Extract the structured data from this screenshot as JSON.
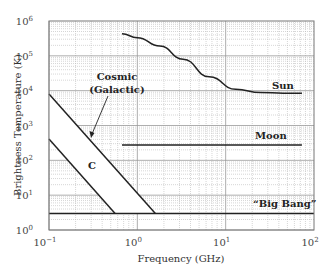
{
  "chart_data": {
    "type": "line",
    "title": "",
    "xlabel": "Frequency (GHz)",
    "ylabel": "Brightness Temperature (K)",
    "xscale": "log",
    "yscale": "log",
    "xlim": [
      0.1,
      100
    ],
    "ylim": [
      1,
      1000000
    ],
    "grid": true,
    "x_ticks": [
      {
        "base": "10",
        "exp": "−1",
        "value": 0.1
      },
      {
        "base": "10",
        "exp": "0",
        "value": 1
      },
      {
        "base": "10",
        "exp": "1",
        "value": 10
      },
      {
        "base": "10",
        "exp": "2",
        "value": 100
      }
    ],
    "y_ticks": [
      {
        "base": "10",
        "exp": "0",
        "value": 1
      },
      {
        "base": "10",
        "exp": "1",
        "value": 10
      },
      {
        "base": "10",
        "exp": "2",
        "value": 100
      },
      {
        "base": "10",
        "exp": "3",
        "value": 1000
      },
      {
        "base": "10",
        "exp": "4",
        "value": 10000
      },
      {
        "base": "10",
        "exp": "5",
        "value": 100000
      },
      {
        "base": "10",
        "exp": "6",
        "value": 1000000
      }
    ],
    "series": [
      {
        "name": "Sun",
        "x": [
          0.67,
          1.0,
          1.8,
          3.3,
          6.5,
          13,
          25,
          45,
          73
        ],
        "y": [
          430000,
          330000,
          190000,
          80000,
          25000,
          11000,
          8800,
          8500,
          8500
        ]
      },
      {
        "name": "Moon",
        "x": [
          0.67,
          73
        ],
        "y": [
          275,
          275
        ]
      },
      {
        "name": "“Big Bang”",
        "x": [
          0.1,
          100
        ],
        "y": [
          3,
          3
        ]
      },
      {
        "name": "Cosmic (Galactic) upper bound",
        "x": [
          0.1,
          1.6
        ],
        "y": [
          8000,
          3
        ]
      },
      {
        "name": "Cosmic (Galactic) lower bound",
        "x": [
          0.1,
          0.56
        ],
        "y": [
          410,
          3
        ]
      }
    ],
    "annotations": [
      {
        "text": "Sun",
        "x": 30,
        "y": 12000
      },
      {
        "text": "Moon",
        "x": 22,
        "y": 500
      },
      {
        "text": "“Big Bang”",
        "x": 28,
        "y": 5
      },
      {
        "text": "C",
        "x": 0.3,
        "y": 120
      },
      {
        "text": "Cosmic",
        "x": 0.33,
        "y": 30000
      },
      {
        "text": "(Galactic)",
        "x": 0.33,
        "y": 11000
      }
    ]
  },
  "labels": {
    "xlabel": "Frequency (GHz)",
    "ylabel": "Brightness Temperature (K)",
    "sun": "Sun",
    "moon": "Moon",
    "bigbang": "“Big Bang”",
    "c": "C",
    "cosmic1": "Cosmic",
    "cosmic2": "(Galactic)"
  }
}
